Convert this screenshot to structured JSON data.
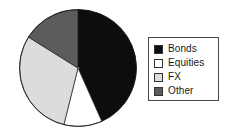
{
  "chart_data": {
    "type": "pie",
    "title": "",
    "subtitle": "",
    "xlabel": "",
    "ylabel": "",
    "grid": false,
    "legend_position": "right",
    "start_angle_deg": 0,
    "direction": "clockwise",
    "categories": [
      "Bonds",
      "Equities",
      "FX",
      "Other"
    ],
    "values": [
      43,
      11,
      30,
      16
    ],
    "units": "percent",
    "slice_angles_deg": [
      156,
      38,
      108,
      58
    ],
    "colors": [
      "#0d0d0d",
      "#ffffff",
      "#dcdcdc",
      "#5c5c5c"
    ],
    "slices": [
      {
        "label": "Bonds",
        "value": 43,
        "angle_deg": 156,
        "color": "#0d0d0d"
      },
      {
        "label": "Equities",
        "value": 11,
        "angle_deg": 38,
        "color": "#ffffff"
      },
      {
        "label": "FX",
        "value": 30,
        "angle_deg": 108,
        "color": "#dcdcdc"
      },
      {
        "label": "Other",
        "value": 16,
        "angle_deg": 58,
        "color": "#5c5c5c"
      }
    ]
  },
  "legend": {
    "items": [
      {
        "label": "Bonds",
        "color": "#0d0d0d"
      },
      {
        "label": "Equities",
        "color": "#ffffff"
      },
      {
        "label": "FX",
        "color": "#dcdcdc"
      },
      {
        "label": "Other",
        "color": "#5c5c5c"
      }
    ]
  },
  "style": {
    "background": "#ffffff",
    "outline_color": "#1a1a1a",
    "legend_border_color": "#4a4a4a",
    "text_color": "#171717"
  }
}
